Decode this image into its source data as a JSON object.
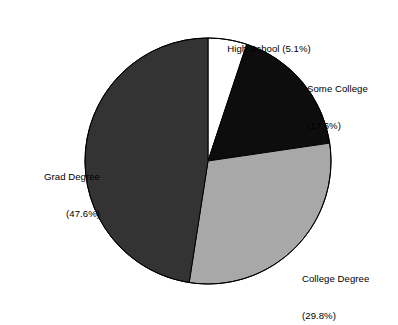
{
  "chart_data": {
    "type": "pie",
    "title": "",
    "subtitle": "",
    "xlabel": "",
    "ylabel": "",
    "legend_position": "none",
    "grid": false,
    "start_angle_deg": 90,
    "direction": "clockwise",
    "categories": [
      "High School",
      "Some College",
      "College Degree",
      "Grad Degree"
    ],
    "values": [
      5.1,
      17.6,
      29.8,
      47.6
    ],
    "value_unit": "percent",
    "colors": [
      "#ffffff",
      "#0d0d0d",
      "#a8a8a8",
      "#333333"
    ],
    "slices": [
      {
        "name": "High School",
        "value": 5.1,
        "percent_text": "(5.1%)",
        "label_line1": "High School (5.1%)",
        "label_line2": "",
        "color": "#ffffff",
        "stroke": "#000000"
      },
      {
        "name": "Some College",
        "value": 17.6,
        "percent_text": "(17.6%)",
        "label_line1": "Some College",
        "label_line2": "(17.6%)",
        "color": "#0d0d0d",
        "stroke": "#000000"
      },
      {
        "name": "College Degree",
        "value": 29.8,
        "percent_text": "(29.8%)",
        "label_line1": "College Degree",
        "label_line2": "(29.8%)",
        "color": "#a8a8a8",
        "stroke": "#000000"
      },
      {
        "name": "Grad Degree",
        "value": 47.6,
        "percent_text": "(47.6%)",
        "label_line1": "Grad Degree",
        "label_line2": "(47.6%)",
        "color": "#333333",
        "stroke": "#000000"
      }
    ],
    "geometry": {
      "center_x": 208,
      "center_y": 161,
      "radius": 123
    }
  }
}
